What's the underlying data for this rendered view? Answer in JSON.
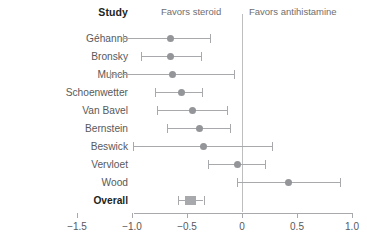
{
  "header": {
    "study_label": "Study",
    "favors_left": "Favors steroid",
    "favors_right": "Favors antihistamine"
  },
  "colors": {
    "marker": "#939598",
    "line": "#a7a9ac",
    "zeroline": "#bcbec0",
    "label": "#58595b",
    "bold_label": "#231f20"
  },
  "chart_data": {
    "type": "forest",
    "title": "",
    "xlabel": "",
    "ylabel": "Study",
    "xlim": [
      -1.5,
      1.0
    ],
    "xticks": [
      -1.5,
      -1.0,
      -0.5,
      0,
      0.5,
      1.0
    ],
    "xticklabels": [
      "−1.5",
      "−1.0",
      "−0.5",
      "0",
      "0.5",
      "1.0"
    ],
    "grid": false,
    "reference_line": 0,
    "legend": [],
    "annotations": [
      "Favors steroid",
      "Favors antihistamine"
    ],
    "categories": [
      "Géhanno",
      "Bronsky",
      "Munch",
      "Schoenwetter",
      "Van Bavel",
      "Bernstein",
      "Beswick",
      "Vervloet",
      "Wood",
      "Overall"
    ],
    "points": [
      {
        "label": "Géhanno",
        "estimate": -0.65,
        "ci_low": -1.08,
        "ci_high": -0.29,
        "summary": false
      },
      {
        "label": "Bronsky",
        "estimate": -0.65,
        "ci_low": -0.92,
        "ci_high": -0.37,
        "summary": false
      },
      {
        "label": "Munch",
        "estimate": -0.63,
        "ci_low": -1.2,
        "ci_high": -0.07,
        "summary": false
      },
      {
        "label": "Schoenwetter",
        "estimate": -0.55,
        "ci_low": -0.79,
        "ci_high": -0.36,
        "summary": false
      },
      {
        "label": "Van Bavel",
        "estimate": -0.45,
        "ci_low": -0.77,
        "ci_high": -0.14,
        "summary": false
      },
      {
        "label": "Bernstein",
        "estimate": -0.39,
        "ci_low": -0.68,
        "ci_high": -0.11,
        "summary": false
      },
      {
        "label": "Beswick",
        "estimate": -0.35,
        "ci_low": -0.99,
        "ci_high": 0.27,
        "summary": false
      },
      {
        "label": "Vervloet",
        "estimate": -0.04,
        "ci_low": -0.31,
        "ci_high": 0.21,
        "summary": false
      },
      {
        "label": "Wood",
        "estimate": 0.42,
        "ci_low": -0.05,
        "ci_high": 0.89,
        "summary": false
      },
      {
        "label": "Overall",
        "estimate": -0.47,
        "ci_low": -0.58,
        "ci_high": -0.35,
        "summary": true
      }
    ]
  }
}
